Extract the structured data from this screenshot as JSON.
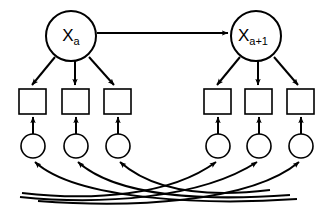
{
  "diagram": {
    "type": "petri-net-state-diagram",
    "colors": {
      "stroke": "#000000",
      "fill": "#ffffff",
      "background": "#ffffff"
    },
    "states": [
      {
        "id": "state-a",
        "base": "X",
        "subscript": "a",
        "cx": 71,
        "cy": 36,
        "r": 25
      },
      {
        "id": "state-a-plus-1",
        "base": "X",
        "subscript": "a+1",
        "cx": 256,
        "cy": 36,
        "r": 25
      }
    ],
    "transitions": [
      {
        "id": "transition-1",
        "x": 19,
        "y": 89,
        "w": 27,
        "h": 25
      },
      {
        "id": "transition-2",
        "x": 62,
        "y": 89,
        "w": 27,
        "h": 25
      },
      {
        "id": "transition-3",
        "x": 104,
        "y": 89,
        "w": 27,
        "h": 25
      },
      {
        "id": "transition-4",
        "x": 204,
        "y": 89,
        "w": 27,
        "h": 25
      },
      {
        "id": "transition-5",
        "x": 245,
        "y": 89,
        "w": 27,
        "h": 25
      },
      {
        "id": "transition-6",
        "x": 287,
        "y": 89,
        "w": 27,
        "h": 25
      }
    ],
    "places": [
      {
        "id": "place-1",
        "cx": 33,
        "cy": 146,
        "r": 12
      },
      {
        "id": "place-2",
        "cx": 76,
        "cy": 146,
        "r": 12
      },
      {
        "id": "place-3",
        "cx": 118,
        "cy": 146,
        "r": 12
      },
      {
        "id": "place-4",
        "cx": 218,
        "cy": 146,
        "r": 12
      },
      {
        "id": "place-5",
        "cx": 259,
        "cy": 146,
        "r": 12
      },
      {
        "id": "place-6",
        "cx": 301,
        "cy": 146,
        "r": 12
      }
    ],
    "edges": {
      "state_transition_arrow": {
        "id": "state-transition-arrow",
        "from": "state-a",
        "to": "state-a-plus-1",
        "x1": 97,
        "x2": 229,
        "y": 33
      },
      "state_to_transition": [
        {
          "id": "edge-a-t1",
          "from": "state-a",
          "to": "transition-1"
        },
        {
          "id": "edge-a-t2",
          "from": "state-a",
          "to": "transition-2"
        },
        {
          "id": "edge-a-t3",
          "from": "state-a",
          "to": "transition-3"
        },
        {
          "id": "edge-a1-t4",
          "from": "state-a-plus-1",
          "to": "transition-4"
        },
        {
          "id": "edge-a1-t5",
          "from": "state-a-plus-1",
          "to": "transition-5"
        },
        {
          "id": "edge-a1-t6",
          "from": "state-a-plus-1",
          "to": "transition-6"
        }
      ],
      "place_to_transition": [
        {
          "id": "edge-p1-t1",
          "from": "place-1",
          "to": "transition-1"
        },
        {
          "id": "edge-p2-t2",
          "from": "place-2",
          "to": "transition-2"
        },
        {
          "id": "edge-p3-t3",
          "from": "place-3",
          "to": "transition-3"
        },
        {
          "id": "edge-p4-t4",
          "from": "place-4",
          "to": "transition-4"
        },
        {
          "id": "edge-p5-t5",
          "from": "place-5",
          "to": "transition-5"
        },
        {
          "id": "edge-p6-t6",
          "from": "place-6",
          "to": "transition-6"
        }
      ],
      "feedback_arcs": [
        {
          "id": "feedback-arc-1",
          "to": "place-1"
        },
        {
          "id": "feedback-arc-2",
          "to": "place-2"
        },
        {
          "id": "feedback-arc-3",
          "to": "place-3"
        },
        {
          "id": "feedback-arc-4",
          "to": "place-4"
        },
        {
          "id": "feedback-arc-5",
          "to": "place-5"
        },
        {
          "id": "feedback-arc-6",
          "to": "place-6"
        }
      ]
    }
  }
}
